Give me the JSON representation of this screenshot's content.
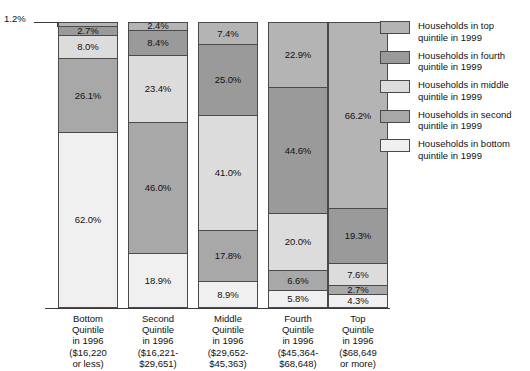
{
  "chart_data": {
    "type": "bar",
    "title": "",
    "xlabel": "",
    "ylabel": "",
    "ylim": [
      0,
      100
    ],
    "grid": false,
    "legend_position": "right",
    "stacked": true,
    "percent": true,
    "categories": [
      "Bottom Quintile in 1996 ($16,220 or less)",
      "Second Quintile in 1996 ($16,221-$29,651)",
      "Middle Quintile in 1996 ($29,652-$45,363)",
      "Fourth Quintile in 1996 ($45,364-$68,648)",
      "Top Quintile in 1996 ($68,649 or more)"
    ],
    "series": [
      {
        "name": "Households in top quintile in 1999",
        "color": "#b4b4b4",
        "values": [
          1.2,
          2.4,
          7.4,
          22.9,
          66.2
        ]
      },
      {
        "name": "Households in fourth quintile in 1999",
        "color": "#9a9a9a",
        "values": [
          2.7,
          8.4,
          25.0,
          44.6,
          19.3
        ]
      },
      {
        "name": "Households in middle quintile in 1999",
        "color": "#dcdcdc",
        "values": [
          8.0,
          23.4,
          41.0,
          20.0,
          7.6
        ]
      },
      {
        "name": "Households in second quintile in 1999",
        "color": "#a8a8a8",
        "values": [
          26.1,
          46.0,
          17.8,
          6.6,
          2.7
        ]
      },
      {
        "name": "Households in bottom quintile in 1999",
        "color": "#f0f0f0",
        "values": [
          62.0,
          18.9,
          8.9,
          5.8,
          4.3
        ]
      }
    ]
  },
  "callout": {
    "label": "1.2%"
  },
  "bars": [
    {
      "id": "bottom-quintile",
      "segments": [
        {
          "label": "1.2%",
          "value": 1.2,
          "series": 0,
          "show_label": false
        },
        {
          "label": "2.7%",
          "value": 2.7,
          "series": 1,
          "show_label": true
        },
        {
          "label": "8.0%",
          "value": 8.0,
          "series": 2,
          "show_label": true
        },
        {
          "label": "26.1%",
          "value": 26.1,
          "series": 3,
          "show_label": true
        },
        {
          "label": "62.0%",
          "value": 62.0,
          "series": 4,
          "show_label": true
        }
      ],
      "category": {
        "line1": "Bottom",
        "line2": "Quintile",
        "line3": "in 1996",
        "line4": "($16,220",
        "line5": "or less)"
      }
    },
    {
      "id": "second-quintile",
      "segments": [
        {
          "label": "2.4%",
          "value": 2.4,
          "series": 0,
          "show_label": true
        },
        {
          "label": "8.4%",
          "value": 8.4,
          "series": 1,
          "show_label": true
        },
        {
          "label": "23.4%",
          "value": 23.4,
          "series": 2,
          "show_label": true
        },
        {
          "label": "46.0%",
          "value": 46.0,
          "series": 3,
          "show_label": true
        },
        {
          "label": "18.9%",
          "value": 18.9,
          "series": 4,
          "show_label": true
        }
      ],
      "category": {
        "line1": "Second",
        "line2": "Quintile",
        "line3": "in 1996",
        "line4": "($16,221-",
        "line5": "$29,651)"
      }
    },
    {
      "id": "middle-quintile",
      "segments": [
        {
          "label": "7.4%",
          "value": 7.4,
          "series": 0,
          "show_label": true
        },
        {
          "label": "25.0%",
          "value": 25.0,
          "series": 1,
          "show_label": true
        },
        {
          "label": "41.0%",
          "value": 41.0,
          "series": 2,
          "show_label": true
        },
        {
          "label": "17.8%",
          "value": 17.8,
          "series": 3,
          "show_label": true
        },
        {
          "label": "8.9%",
          "value": 8.9,
          "series": 4,
          "show_label": true
        }
      ],
      "category": {
        "line1": "Middle",
        "line2": "Quintile",
        "line3": "in 1996",
        "line4": "($29,652-",
        "line5": "$45,363)"
      }
    },
    {
      "id": "fourth-quintile",
      "segments": [
        {
          "label": "22.9%",
          "value": 22.9,
          "series": 0,
          "show_label": true
        },
        {
          "label": "44.6%",
          "value": 44.6,
          "series": 1,
          "show_label": true
        },
        {
          "label": "20.0%",
          "value": 20.0,
          "series": 2,
          "show_label": true
        },
        {
          "label": "6.6%",
          "value": 6.6,
          "series": 3,
          "show_label": true
        },
        {
          "label": "5.8%",
          "value": 5.8,
          "series": 4,
          "show_label": true
        }
      ],
      "category": {
        "line1": "Fourth",
        "line2": "Quintile",
        "line3": "in 1996",
        "line4": "($45,364-",
        "line5": "$68,648)"
      }
    },
    {
      "id": "top-quintile",
      "segments": [
        {
          "label": "66.2%",
          "value": 66.2,
          "series": 0,
          "show_label": true
        },
        {
          "label": "19.3%",
          "value": 19.3,
          "series": 1,
          "show_label": true
        },
        {
          "label": "7.6%",
          "value": 7.6,
          "series": 2,
          "show_label": true
        },
        {
          "label": "2.7%",
          "value": 2.7,
          "series": 3,
          "show_label": true
        },
        {
          "label": "4.3%",
          "value": 4.3,
          "series": 4,
          "show_label": true
        }
      ],
      "category": {
        "line1": "Top",
        "line2": "Quintile",
        "line3": "in 1996",
        "line4": "($68,649",
        "line5": "or more)"
      }
    }
  ],
  "legend": [
    {
      "label_line1": "Households in top",
      "label_line2": "quintile in 1999",
      "color": "#b4b4b4"
    },
    {
      "label_line1": "Households in fourth",
      "label_line2": "quintile in 1999",
      "color": "#9a9a9a"
    },
    {
      "label_line1": "Households in middle",
      "label_line2": "quintile in 1999",
      "color": "#dcdcdc"
    },
    {
      "label_line1": "Households in second",
      "label_line2": "quintile in 1999",
      "color": "#a8a8a8"
    },
    {
      "label_line1": "Households in bottom",
      "label_line2": "quintile in 1999",
      "color": "#f0f0f0"
    }
  ]
}
